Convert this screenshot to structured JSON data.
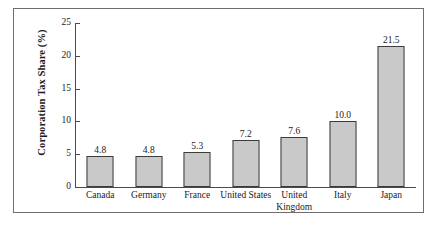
{
  "chart_data": {
    "type": "bar",
    "title": "",
    "xlabel": "",
    "ylabel": "Corporation Tax Share (%)",
    "categories": [
      "Canada",
      "Germany",
      "France",
      "United States",
      "United Kingdom",
      "Italy",
      "Japan"
    ],
    "values": [
      4.8,
      4.8,
      5.3,
      7.2,
      7.6,
      10.0,
      21.5
    ],
    "value_labels": [
      "4.8",
      "4.8",
      "5.3",
      "7.2",
      "7.6",
      "10.0",
      "21.5"
    ],
    "ylim": [
      0,
      25
    ],
    "yticks": [
      0,
      5,
      10,
      15,
      20,
      25
    ],
    "ytick_labels": [
      "0",
      "5",
      "10",
      "15",
      "20",
      "25"
    ],
    "grid": false,
    "legend": "none",
    "bar_fill_color": "#c9c9c9",
    "bar_edge_color": "#3c3c3c",
    "axis_color": "#4a4a4a",
    "frame_color": "#6e6e6e",
    "background_color": "#ffffff"
  }
}
